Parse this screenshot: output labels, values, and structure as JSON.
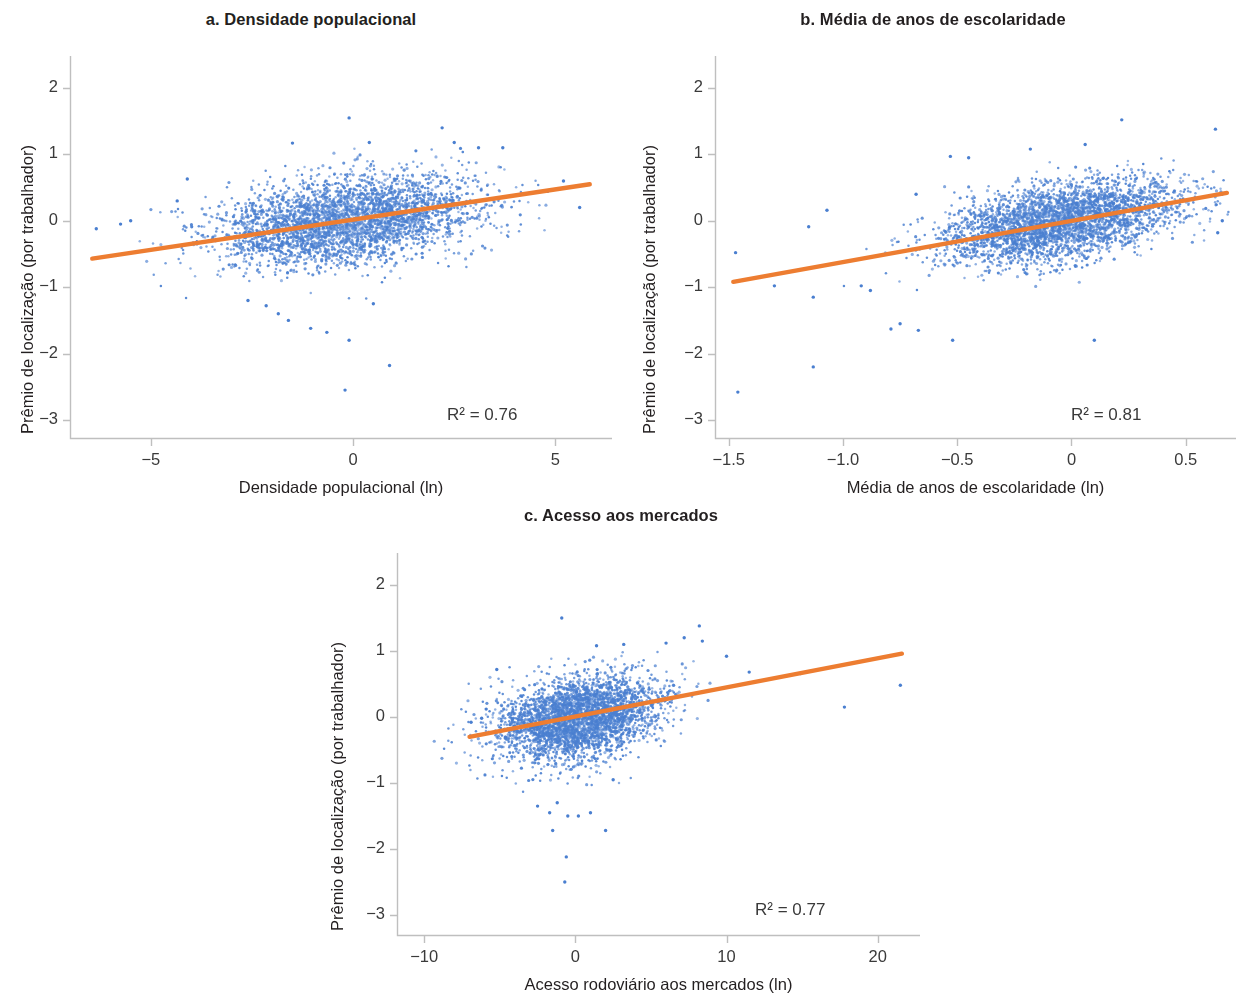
{
  "figure": {
    "background": "#ffffff",
    "point_color": "#4a7fd0",
    "line_color": "#ed7d31",
    "axis_color": "#bfbfbf",
    "text_color": "#231f20"
  },
  "chart_data": [
    {
      "id": "a",
      "type": "scatter",
      "title": "a. Densidade populacional",
      "xlabel": "Densidade populacional (ln)",
      "ylabel": "Prêmio de localização (por trabalhador)",
      "annotation": "R² = 0.76",
      "r_squared": 0.76,
      "xlim": [
        -7.0,
        6.4
      ],
      "ylim": [
        -3.45,
        2.45
      ],
      "xticks": [
        -5,
        0,
        5
      ],
      "xticklabels": [
        "−5",
        "0",
        "5"
      ],
      "yticks": [
        2,
        1,
        0,
        -1,
        -2,
        -3
      ],
      "yticklabels": [
        "2",
        "1",
        "0",
        "−1",
        "−2",
        "−3"
      ],
      "grid": false,
      "legend": "none",
      "n_points": 3600,
      "cloud": {
        "x_mean": -0.15,
        "x_sd": 1.55,
        "y_mean": 0.0,
        "y_sd": 0.33,
        "corr": 0.32,
        "skew_low_y": -0.45
      },
      "fit_line": {
        "x_start": -6.45,
        "y_start": -0.57,
        "x_end": 5.85,
        "y_end": 0.55,
        "slope": 0.091,
        "intercept": -0.0135
      },
      "outliers": [
        {
          "x": -6.35,
          "y": -0.12
        },
        {
          "x": -5.75,
          "y": -0.05
        },
        {
          "x": -5.5,
          "y": 0.0
        },
        {
          "x": -4.1,
          "y": 0.63
        },
        {
          "x": -4.35,
          "y": 0.3
        },
        {
          "x": -0.1,
          "y": 1.55
        },
        {
          "x": -1.5,
          "y": 1.17
        },
        {
          "x": 2.2,
          "y": 1.4
        },
        {
          "x": 0.4,
          "y": 1.18
        },
        {
          "x": 3.7,
          "y": 1.1
        },
        {
          "x": 2.5,
          "y": 1.18
        },
        {
          "x": 3.1,
          "y": 1.1
        },
        {
          "x": -2.6,
          "y": -1.2
        },
        {
          "x": -2.15,
          "y": -1.28
        },
        {
          "x": -1.85,
          "y": -1.4
        },
        {
          "x": -1.6,
          "y": -1.5
        },
        {
          "x": -1.05,
          "y": -1.62
        },
        {
          "x": -0.65,
          "y": -1.68
        },
        {
          "x": -0.1,
          "y": -1.8
        },
        {
          "x": 0.5,
          "y": -1.25
        },
        {
          "x": 0.9,
          "y": -2.18
        },
        {
          "x": -0.2,
          "y": -2.55
        },
        {
          "x": 5.6,
          "y": 0.2
        },
        {
          "x": 5.2,
          "y": 0.6
        }
      ]
    },
    {
      "id": "b",
      "type": "scatter",
      "title": "b. Média de anos de escolaridade",
      "xlabel": "Média de anos de escolaridade (ln)",
      "ylabel": "Prêmio de localização (por trabalhador)",
      "annotation": "R² = 0.81",
      "r_squared": 0.81,
      "xlim": [
        -1.56,
        0.72
      ],
      "ylim": [
        -3.45,
        2.45
      ],
      "xticks": [
        -1.5,
        -1.0,
        -0.5,
        0,
        0.5
      ],
      "xticklabels": [
        "−1.5",
        "−1.0",
        "−0.5",
        "0",
        "0.5"
      ],
      "yticks": [
        2,
        1,
        0,
        -1,
        -2,
        -3
      ],
      "yticklabels": [
        "2",
        "1",
        "0",
        "−1",
        "−2",
        "−3"
      ],
      "grid": false,
      "legend": "none",
      "n_points": 3600,
      "cloud": {
        "x_mean": -0.05,
        "x_sd": 0.26,
        "y_mean": 0.0,
        "y_sd": 0.3,
        "corr": 0.46,
        "skew_low_y": -0.42
      },
      "fit_line": {
        "x_start": -1.48,
        "y_start": -0.92,
        "x_end": 0.68,
        "y_end": 0.42,
        "slope": 0.62,
        "intercept": -0.0,
        "note": "ends ~0.43 at right edge"
      },
      "outliers": [
        {
          "x": -1.47,
          "y": -0.48
        },
        {
          "x": -1.46,
          "y": -2.58
        },
        {
          "x": -1.3,
          "y": -0.98
        },
        {
          "x": -1.13,
          "y": -1.15
        },
        {
          "x": -1.13,
          "y": -2.2
        },
        {
          "x": -1.15,
          "y": -0.09
        },
        {
          "x": -1.07,
          "y": 0.16
        },
        {
          "x": -0.92,
          "y": -0.98
        },
        {
          "x": -0.88,
          "y": -1.05
        },
        {
          "x": -0.79,
          "y": -1.63
        },
        {
          "x": -0.75,
          "y": -1.55
        },
        {
          "x": -0.67,
          "y": -1.65
        },
        {
          "x": -0.52,
          "y": -1.8
        },
        {
          "x": 0.1,
          "y": -1.8
        },
        {
          "x": 0.22,
          "y": 1.52
        },
        {
          "x": 0.63,
          "y": 1.38
        },
        {
          "x": 0.06,
          "y": 1.15
        },
        {
          "x": -0.18,
          "y": 1.08
        },
        {
          "x": -0.53,
          "y": 0.97
        },
        {
          "x": -0.45,
          "y": 0.95
        },
        {
          "x": -0.68,
          "y": 0.4
        },
        {
          "x": 0.66,
          "y": 0.0
        },
        {
          "x": 0.64,
          "y": -0.18
        }
      ]
    },
    {
      "id": "c",
      "type": "scatter",
      "title": "c. Acesso aos mercados",
      "xlabel": "Acesso rodoviário aos mercados (ln)",
      "ylabel": "Prêmio de localização (por trabalhador)",
      "annotation": "R² = 0.77",
      "r_squared": 0.77,
      "xlim": [
        -11.8,
        22.8
      ],
      "ylim": [
        -3.45,
        2.45
      ],
      "xticks": [
        -10,
        0,
        10,
        20
      ],
      "xticklabels": [
        "−10",
        "0",
        "10",
        "20"
      ],
      "yticks": [
        2,
        1,
        0,
        -1,
        -2,
        -3
      ],
      "yticklabels": [
        "2",
        "1",
        "0",
        "−1",
        "−2",
        "−3"
      ],
      "grid": false,
      "legend": "none",
      "n_points": 3600,
      "cloud": {
        "x_mean": 0.2,
        "x_sd": 2.6,
        "y_mean": 0.0,
        "y_sd": 0.3,
        "corr": 0.3,
        "skew_low_y": -0.5
      },
      "fit_line": {
        "x_start": -7.0,
        "y_start": -0.3,
        "x_end": 21.6,
        "y_end": 0.96,
        "slope": 0.044,
        "intercept": 0.008
      },
      "outliers": [
        {
          "x": -6.9,
          "y": -0.08
        },
        {
          "x": -6.2,
          "y": -0.02
        },
        {
          "x": -5.9,
          "y": 0.12
        },
        {
          "x": -5.2,
          "y": 0.72
        },
        {
          "x": -0.9,
          "y": 1.5
        },
        {
          "x": 8.2,
          "y": 1.38
        },
        {
          "x": 7.2,
          "y": 1.2
        },
        {
          "x": 8.4,
          "y": 1.15
        },
        {
          "x": 6.0,
          "y": 1.12
        },
        {
          "x": 3.2,
          "y": 1.1
        },
        {
          "x": 1.4,
          "y": 1.08
        },
        {
          "x": 10.0,
          "y": 0.92
        },
        {
          "x": 11.5,
          "y": 0.68
        },
        {
          "x": 14.9,
          "y": 0.66
        },
        {
          "x": 17.8,
          "y": 0.15
        },
        {
          "x": 21.5,
          "y": 0.48
        },
        {
          "x": -2.5,
          "y": -1.35
        },
        {
          "x": -1.7,
          "y": -1.45
        },
        {
          "x": -1.2,
          "y": -1.3
        },
        {
          "x": -0.5,
          "y": -1.5
        },
        {
          "x": 0.2,
          "y": -1.5
        },
        {
          "x": 1.0,
          "y": -1.45
        },
        {
          "x": 2.0,
          "y": -1.72
        },
        {
          "x": -1.5,
          "y": -1.72
        },
        {
          "x": -0.6,
          "y": -2.12
        },
        {
          "x": -0.7,
          "y": -2.5
        },
        {
          "x": 2.5,
          "y": -0.95
        }
      ]
    }
  ]
}
